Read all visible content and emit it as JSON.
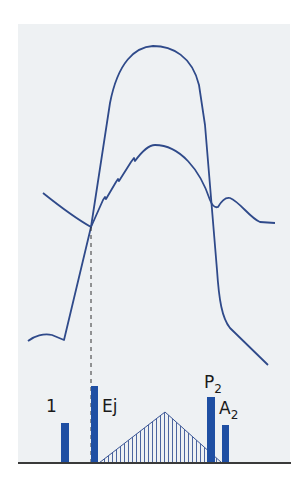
{
  "diagram": {
    "colors": {
      "panel_bg": "#eef1f3",
      "curve": "#2f4a8a",
      "bar": "#1f4fa3",
      "baseline": "#3a3a3a",
      "dashed": "#333333",
      "hatch": "#3a5595"
    },
    "curves": [
      {
        "name": "ventricular-pressure",
        "path": "M28,341 C34,336 44,333 52,335 L64,340 L91,227 L110,103 C118,62 135,47 153,46 C172,46 192,56 199,85 L205,125 L217,270 C219,300 222,318 230,328 L268,365"
      },
      {
        "name": "arterial-pressure",
        "path": "M43,193 C58,205 75,218 91,227 L103,200 L105,197 L106,199 L116,182 L118,179 L119,181 L131,162 L134,158 L135,161 C143,150 150,145 155,145 C180,145 200,170 210,200 C212,205 215,208 218,207 C222,200 226,197 230,198 C240,202 250,218 260,222 L275,223"
      }
    ],
    "dashed_line": {
      "x": 91,
      "y1": 227,
      "y2": 463
    },
    "baseline": {
      "x1": 18,
      "x2": 291,
      "y": 463
    },
    "bars": [
      {
        "id": "S1",
        "label": "1",
        "sub": "",
        "x": 61,
        "width": 8,
        "top": 423,
        "label_x": 46,
        "label_y": 412
      },
      {
        "id": "Ej",
        "label": "Ej",
        "sub": "",
        "x": 91,
        "width": 7,
        "top": 386,
        "label_x": 102,
        "label_y": 412
      },
      {
        "id": "P2",
        "label": "P",
        "sub": "2",
        "x": 207,
        "width": 8,
        "top": 397,
        "label_x": 204,
        "label_y": 388
      },
      {
        "id": "A2",
        "label": "A",
        "sub": "2",
        "x": 222,
        "width": 7,
        "top": 425,
        "label_x": 219,
        "label_y": 414
      }
    ],
    "murmur": {
      "x_start": 99,
      "apex_x": 165,
      "apex_y": 412,
      "x_end": 222,
      "y_base": 463,
      "hatch_spacing": 4
    }
  }
}
